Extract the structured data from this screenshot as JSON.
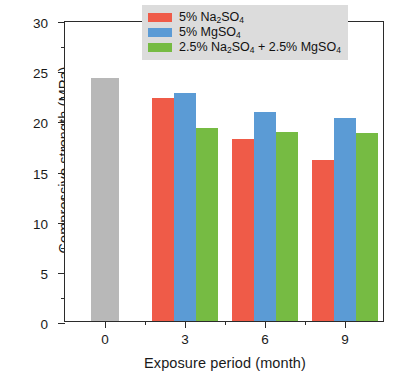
{
  "chart_data": {
    "type": "bar",
    "title": "",
    "xlabel": "Exposure period (month)",
    "ylabel": "Compressive strength (MPa)",
    "categories": [
      "0",
      "3",
      "6",
      "9"
    ],
    "xlim": [
      0,
      4
    ],
    "ylim": [
      0,
      30
    ],
    "ytick_labels": [
      "0",
      "5",
      "10",
      "15",
      "20",
      "25",
      "30"
    ],
    "ytick_values": [
      0,
      5,
      10,
      15,
      20,
      25,
      30
    ],
    "yminor_values": [
      2.5,
      7.5,
      12.5,
      17.5,
      22.5,
      27.5
    ],
    "grid": false,
    "legend_position": "top-right",
    "series": [
      {
        "name": "control",
        "label": "",
        "color": "#b8b8b8",
        "values": [
          24.2,
          null,
          null,
          null
        ],
        "in_legend": false
      },
      {
        "name": "na2so4",
        "label": "5% Na2SO4",
        "label_html": "5% Na<sub>2</sub>SO<sub>4</sub>",
        "color": "#ef5b48",
        "values": [
          null,
          22.2,
          18.1,
          16.0
        ],
        "in_legend": true
      },
      {
        "name": "mgso4",
        "label": "5% MgSO4",
        "label_html": "5% MgSO<sub>4</sub>",
        "color": "#5b9bd5",
        "values": [
          null,
          22.7,
          20.8,
          20.2
        ],
        "in_legend": true
      },
      {
        "name": "mixed",
        "label": "2.5% Na2SO4 + 2.5% MgSO4",
        "label_html": "2.5% Na<sub>2</sub>SO<sub>4</sub> + 2.5% MgSO<sub>4</sub>",
        "color": "#76bb43",
        "values": [
          null,
          19.2,
          18.8,
          18.7
        ],
        "in_legend": true
      }
    ]
  },
  "legend": {
    "background": "#dcdcdc",
    "entries": [
      {
        "label_html": "5% Na<sub>2</sub>SO<sub>4</sub>",
        "color": "#ef5b48"
      },
      {
        "label_html": "5% MgSO<sub>4</sub>",
        "color": "#5b9bd5"
      },
      {
        "label_html": "2.5% Na<sub>2</sub>SO<sub>4</sub> + 2.5% MgSO<sub>4</sub>",
        "color": "#76bb43"
      }
    ]
  },
  "axes": {
    "frame_color": "#2b2b2b",
    "background": "#ffffff"
  }
}
